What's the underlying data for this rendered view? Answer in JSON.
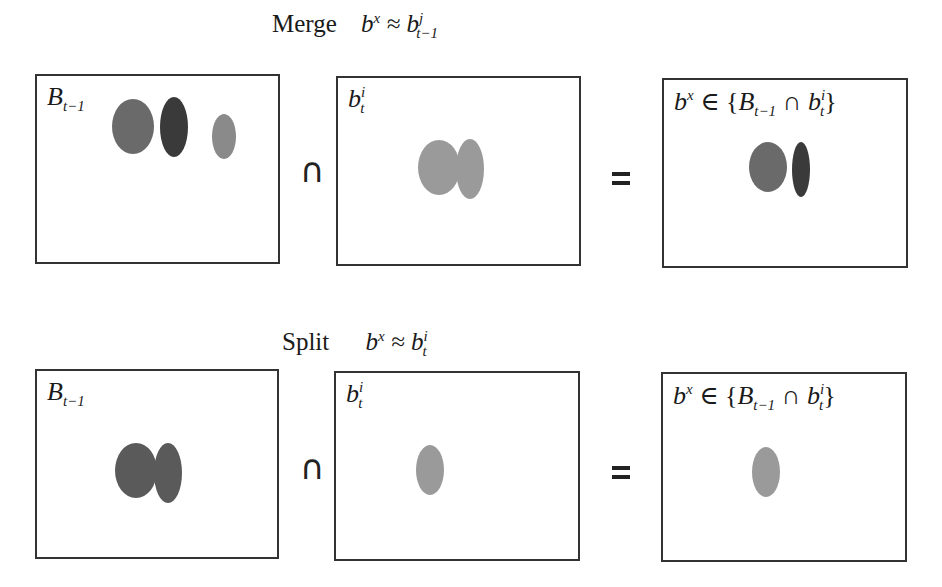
{
  "merge": {
    "title_word": "Merge",
    "title_formula": {
      "lhs": "b",
      "lhs_sup": "x",
      "rel": "≈",
      "rhs": "b",
      "rhs_sup": "j",
      "rhs_sub": "t−1"
    },
    "panels": [
      {
        "label": "B",
        "label_sub": "t−1",
        "blobs": [
          {
            "cx": 133,
            "cy": 126,
            "w": 42,
            "h": 55,
            "color": "#6a6a6a"
          },
          {
            "cx": 174,
            "cy": 126,
            "w": 28,
            "h": 60,
            "color": "#3a3a3a"
          },
          {
            "cx": 224,
            "cy": 136,
            "w": 24,
            "h": 45,
            "color": "#888888"
          }
        ]
      },
      {
        "label": "b",
        "label_sup": "i",
        "label_sub": "t",
        "blobs": [
          {
            "cx": 440,
            "cy": 126,
            "w": 42,
            "h": 55,
            "color": "#9a9a9a"
          },
          {
            "cx": 470,
            "cy": 129,
            "w": 28,
            "h": 60,
            "color": "#9a9a9a"
          }
        ]
      },
      {
        "label": "b",
        "label_sup": "x",
        "formula": "∈ {B",
        "formula_sub": "t−1",
        "formula_mid": "∩ b",
        "formula_sup2": "i",
        "formula_sub2": "t",
        "formula_end": "}",
        "blobs": [
          {
            "cx": 768,
            "cy": 166,
            "w": 38,
            "h": 50,
            "color": "#6a6a6a"
          },
          {
            "cx": 801,
            "cy": 169,
            "w": 18,
            "h": 55,
            "color": "#3a3a3a"
          }
        ]
      }
    ],
    "operators": {
      "intersect": "∩",
      "equals": "="
    }
  },
  "split": {
    "title_word": "Split",
    "title_formula": {
      "lhs": "b",
      "lhs_sup": "x",
      "rel": "≈",
      "rhs": "b",
      "rhs_sup": "i",
      "rhs_sub": "t"
    },
    "panels": [
      {
        "label": "B",
        "label_sub": "t−1",
        "blobs": [
          {
            "cx": 137,
            "cy": 470,
            "w": 42,
            "h": 55,
            "color": "#5a5a5a"
          },
          {
            "cx": 167,
            "cy": 473,
            "w": 28,
            "h": 60,
            "color": "#5a5a5a"
          }
        ]
      },
      {
        "label": "b",
        "label_sup": "i",
        "label_sub": "t",
        "blobs": [
          {
            "cx": 431,
            "cy": 470,
            "w": 28,
            "h": 50,
            "color": "#9a9a9a"
          }
        ]
      },
      {
        "label": "b",
        "label_sup": "x",
        "blobs": [
          {
            "cx": 767,
            "cy": 471,
            "w": 28,
            "h": 50,
            "color": "#9a9a9a"
          }
        ]
      }
    ],
    "operators": {
      "intersect": "∩",
      "equals": "="
    }
  }
}
